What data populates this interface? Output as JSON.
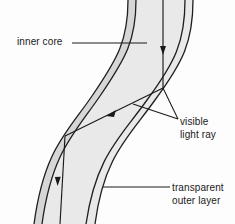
{
  "figure": {
    "background_color": "#fdfdfd",
    "core_fill_color": "#e7e7e7",
    "cladding_fill_color": "#d4d4d4",
    "outline_color": "#1a1a1a",
    "ray_color": "#1a1a1a",
    "leader_color": "#1a1a1a"
  },
  "labels": {
    "inner_core": {
      "text": "inner core",
      "lines": [
        "inner core"
      ]
    },
    "visible_light_ray": {
      "text": "visible light ray",
      "lines": [
        "visible",
        "light ray"
      ]
    },
    "transparent_outer_layer": {
      "text": "transparent outer layer",
      "lines": [
        "transparent",
        "outer layer"
      ]
    }
  },
  "geometry": {
    "fibre": {
      "description": "S-shaped fibre running from top edge to bottom edge",
      "left_outer_edge": "M 128,0 C 128,40 118,58 92,96 C 66,134 44,150 34,224",
      "left_inner_edge": "M 136,0 C 136,40 126,58 100,96 C 74,134 52,152 42,224",
      "right_outer_edge": "M 185,0 C 185,42 175,62 147,100 C 120,138 96,156 86,224",
      "right_inner_edge": "M 193,0 C 193,42 183,62 155,100 C 128,138 104,156 95,224"
    },
    "ray": {
      "description": "Light ray entering top, reflecting off right wall then left wall, exiting bottom",
      "points": [
        {
          "x": 163,
          "y": 0,
          "note": "entry at top"
        },
        {
          "x": 163,
          "y": 88,
          "note": "first reflection at right inner wall"
        },
        {
          "x": 65,
          "y": 136,
          "note": "second reflection at left inner wall"
        },
        {
          "x": 60,
          "y": 224,
          "note": "exit at bottom"
        }
      ],
      "arrowheads": [
        {
          "x": 163,
          "y": 50,
          "direction": "down"
        },
        {
          "x": 110,
          "y": 114,
          "direction": "up-left"
        },
        {
          "x": 57,
          "y": 181,
          "direction": "down"
        }
      ]
    },
    "leaders": {
      "inner_core": {
        "x1": 72,
        "y1": 43,
        "x2": 147,
        "y2": 43
      },
      "visible_light_ray_upper": {
        "x1": 178,
        "y1": 119,
        "x2": 163,
        "y2": 88
      },
      "visible_light_ray_lower": {
        "x1": 178,
        "y1": 119,
        "x2": 133,
        "y2": 104
      },
      "transparent_outer_layer": {
        "x1": 103,
        "y1": 187,
        "x2": 170,
        "y2": 187
      }
    }
  }
}
